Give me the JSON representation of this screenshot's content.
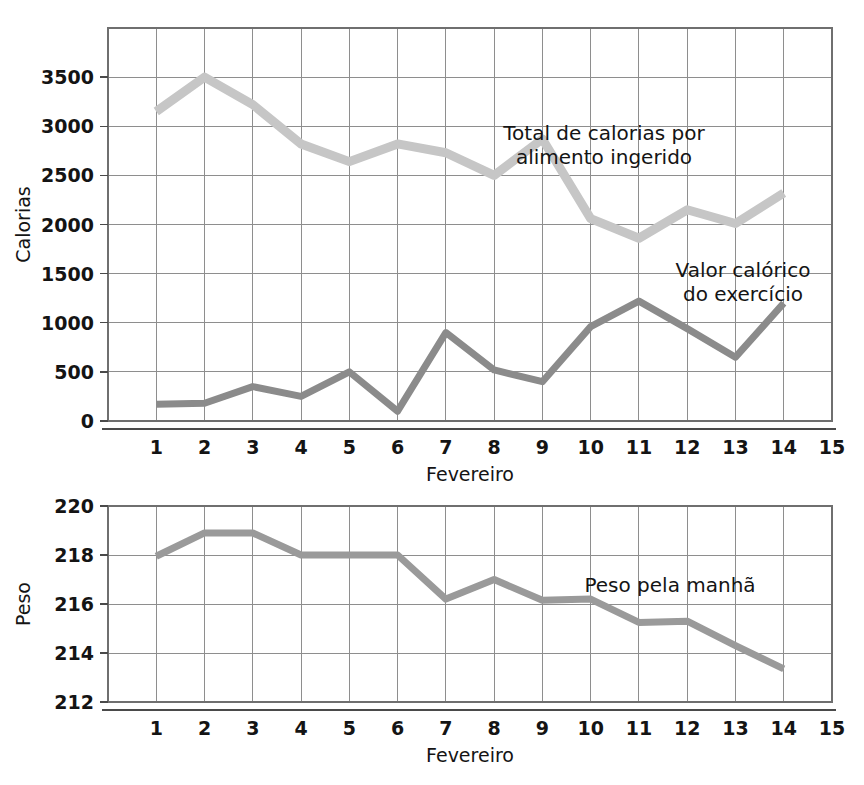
{
  "figure": {
    "background_color": "#ffffff"
  },
  "chart_data": [
    {
      "type": "line",
      "id": "calorias",
      "title": "",
      "xlabel": "Fevereiro",
      "ylabel": "Calorias",
      "grid": true,
      "legend_position": "inline-annotation",
      "x": [
        1,
        2,
        3,
        4,
        5,
        6,
        7,
        8,
        9,
        10,
        11,
        12,
        13,
        14
      ],
      "xlim": [
        0,
        15
      ],
      "ylim": [
        0,
        4000
      ],
      "xticks": [
        1,
        2,
        3,
        4,
        5,
        6,
        7,
        8,
        9,
        10,
        11,
        12,
        13,
        14,
        15
      ],
      "xtick_labels": [
        "1",
        "2",
        "3",
        "4",
        "5",
        "6",
        "7",
        "8",
        "9",
        "10",
        "11",
        "12",
        "13",
        "14",
        "15"
      ],
      "yticks": [
        0,
        500,
        1000,
        1500,
        2000,
        2500,
        3000,
        3500
      ],
      "ytick_labels": [
        "0",
        "500",
        "1000",
        "1500",
        "2000",
        "2500",
        "3000",
        "3500"
      ],
      "series": [
        {
          "name": "Total de calorias por alimento ingerido",
          "color": "#c6c6c6",
          "width": 9,
          "values": [
            3150,
            3500,
            3220,
            2820,
            2640,
            2820,
            2730,
            2500,
            2870,
            2060,
            1860,
            2150,
            2010,
            2320
          ]
        },
        {
          "name": "Valor calórico do exercício",
          "color": "#8b8b8b",
          "width": 7,
          "values": [
            170,
            180,
            350,
            250,
            500,
            100,
            900,
            520,
            400,
            960,
            1220,
            940,
            650,
            1200
          ]
        }
      ],
      "annotations": [
        {
          "id": "annotation-calorias",
          "lines": [
            "Total de calorias por",
            "alimento ingerido"
          ],
          "align": "center",
          "x_px": 604,
          "y_px": 140
        },
        {
          "id": "annotation-exercicio",
          "lines": [
            "Valor calórico",
            "do exercício"
          ],
          "align": "center",
          "x_px": 743,
          "y_px": 277
        }
      ]
    },
    {
      "type": "line",
      "id": "peso",
      "title": "",
      "xlabel": "Fevereiro",
      "ylabel": "Peso",
      "grid": true,
      "legend_position": "inline-annotation",
      "x": [
        1,
        2,
        3,
        4,
        5,
        6,
        7,
        8,
        9,
        10,
        11,
        12,
        13,
        14
      ],
      "xlim": [
        0,
        15
      ],
      "ylim": [
        212,
        220
      ],
      "xticks": [
        1,
        2,
        3,
        4,
        5,
        6,
        7,
        8,
        9,
        10,
        11,
        12,
        13,
        14,
        15
      ],
      "xtick_labels": [
        "1",
        "2",
        "3",
        "4",
        "5",
        "6",
        "7",
        "8",
        "9",
        "10",
        "11",
        "12",
        "13",
        "14",
        "15"
      ],
      "yticks": [
        212,
        214,
        216,
        218,
        220
      ],
      "ytick_labels": [
        "212",
        "214",
        "216",
        "218",
        "220"
      ],
      "series": [
        {
          "name": "Peso pela manhã",
          "color": "#9a9a9a",
          "width": 7,
          "values": [
            217.95,
            218.9,
            218.9,
            218.0,
            218.0,
            218.0,
            216.2,
            217.0,
            216.15,
            216.2,
            215.25,
            215.3,
            214.3,
            213.35
          ]
        }
      ],
      "annotations": [
        {
          "id": "annotation-peso",
          "lines": [
            "Peso pela manhã"
          ],
          "align": "center",
          "x_px": 670,
          "y_px": 592
        }
      ]
    }
  ]
}
